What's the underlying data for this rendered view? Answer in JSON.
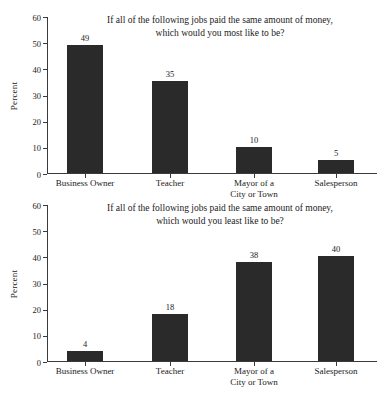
{
  "top_clipped_text": "· · · · · ·",
  "axis": {
    "ylabel": "Percent",
    "yticks": [
      "0",
      "10",
      "20",
      "30",
      "40",
      "50",
      "60"
    ]
  },
  "charts": [
    {
      "title_line1": "If all of the following jobs paid the same amount of money,",
      "title_line2": "which would you most like to be?",
      "chart_data": {
        "type": "bar",
        "title": "If all of the following jobs paid the same amount of money, which would you most like to be?",
        "xlabel": "",
        "ylabel": "Percent",
        "ylim": [
          0,
          60
        ],
        "yticks": [
          0,
          10,
          20,
          30,
          40,
          50,
          60
        ],
        "grid": false,
        "legend": "none",
        "categories": [
          "Business Owner",
          "Teacher",
          "Mayor of a City or Town",
          "Salesperson"
        ],
        "values": [
          49,
          35,
          10,
          5
        ]
      },
      "bars": [
        {
          "label_line1": "Business Owner",
          "label_line2": "",
          "value": 49,
          "value_text": "49"
        },
        {
          "label_line1": "Teacher",
          "label_line2": "",
          "value": 35,
          "value_text": "35"
        },
        {
          "label_line1": "Mayor of a",
          "label_line2": "City or Town",
          "value": 10,
          "value_text": "10"
        },
        {
          "label_line1": "Salesperson",
          "label_line2": "",
          "value": 5,
          "value_text": "5"
        }
      ]
    },
    {
      "title_line1": "If all of the following jobs paid the same amount of money,",
      "title_line2": "which would you least like to be?",
      "chart_data": {
        "type": "bar",
        "title": "If all of the following jobs paid the same amount of money, which would you least like to be?",
        "xlabel": "",
        "ylabel": "Percent",
        "ylim": [
          0,
          60
        ],
        "yticks": [
          0,
          10,
          20,
          30,
          40,
          50,
          60
        ],
        "grid": false,
        "legend": "none",
        "categories": [
          "Business Owner",
          "Teacher",
          "Mayor of a City or Town",
          "Salesperson"
        ],
        "values": [
          4,
          18,
          38,
          40
        ]
      },
      "bars": [
        {
          "label_line1": "Business Owner",
          "label_line2": "",
          "value": 4,
          "value_text": "4"
        },
        {
          "label_line1": "Teacher",
          "label_line2": "",
          "value": 18,
          "value_text": "18"
        },
        {
          "label_line1": "Mayor of a",
          "label_line2": "City or Town",
          "value": 38,
          "value_text": "38"
        },
        {
          "label_line1": "Salesperson",
          "label_line2": "",
          "value": 40,
          "value_text": "40"
        }
      ]
    }
  ],
  "colors": {
    "bar": "#2a2a2a",
    "axis": "#3a3a3a",
    "text": "#1a1a1a",
    "background": "#ffffff"
  }
}
